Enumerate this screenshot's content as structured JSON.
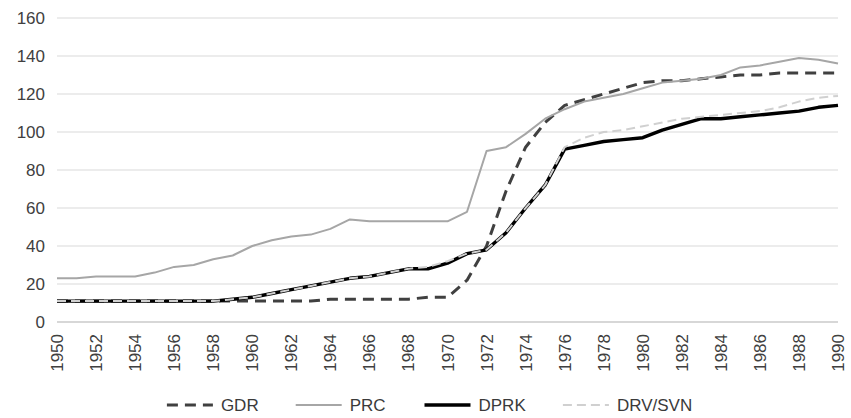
{
  "chart_data": {
    "type": "line",
    "title": "",
    "subtitle": "",
    "xlabel": "",
    "ylabel": "",
    "xlim": [
      1950,
      1990
    ],
    "ylim": [
      0,
      160
    ],
    "ytick_values": [
      0,
      20,
      40,
      60,
      80,
      100,
      120,
      140,
      160
    ],
    "ytick_labels": [
      "0",
      "20",
      "40",
      "60",
      "80",
      "100",
      "120",
      "140",
      "160"
    ],
    "xtick_values": [
      1950,
      1952,
      1954,
      1956,
      1958,
      1960,
      1962,
      1964,
      1966,
      1968,
      1970,
      1972,
      1974,
      1976,
      1978,
      1980,
      1982,
      1984,
      1986,
      1988,
      1990
    ],
    "xtick_labels": [
      "1950",
      "1952",
      "1954",
      "1956",
      "1958",
      "1960",
      "1962",
      "1964",
      "1966",
      "1968",
      "1970",
      "1972",
      "1974",
      "1976",
      "1978",
      "1980",
      "1982",
      "1984",
      "1986",
      "1988",
      "1990"
    ],
    "xtick_rotation": 90,
    "grid": "horizontal",
    "legend_position": "bottom",
    "x": [
      1950,
      1951,
      1952,
      1953,
      1954,
      1955,
      1956,
      1957,
      1958,
      1959,
      1960,
      1961,
      1962,
      1963,
      1964,
      1965,
      1966,
      1967,
      1968,
      1969,
      1970,
      1971,
      1972,
      1973,
      1974,
      1975,
      1976,
      1977,
      1978,
      1979,
      1980,
      1981,
      1982,
      1983,
      1984,
      1985,
      1986,
      1987,
      1988,
      1989,
      1990
    ],
    "series": [
      {
        "name": "GDR",
        "style": "dashed",
        "color": "#404040",
        "width": 3.0,
        "dash": "11,7",
        "values": [
          11,
          11,
          11,
          11,
          11,
          11,
          11,
          11,
          11,
          11,
          11,
          11,
          11,
          11,
          12,
          12,
          12,
          12,
          12,
          13,
          13,
          22,
          40,
          69,
          92,
          105,
          114,
          117,
          120,
          123,
          126,
          127,
          127,
          128,
          129,
          130,
          130,
          131,
          131,
          131,
          131
        ]
      },
      {
        "name": "PRC",
        "style": "solid",
        "color": "#a6a6a6",
        "width": 2.0,
        "dash": "none",
        "values": [
          23,
          23,
          24,
          24,
          24,
          26,
          29,
          30,
          33,
          35,
          40,
          43,
          45,
          46,
          49,
          54,
          53,
          53,
          53,
          53,
          53,
          58,
          90,
          92,
          99,
          107,
          112,
          116,
          118,
          120,
          123,
          126,
          127,
          128,
          130,
          134,
          135,
          137,
          139,
          138,
          136
        ]
      },
      {
        "name": "DPRK",
        "style": "solid",
        "color": "#000000",
        "width": 3.4,
        "dash": "none",
        "values": [
          11,
          11,
          11,
          11,
          11,
          11,
          11,
          11,
          11,
          12,
          13,
          15,
          17,
          19,
          21,
          23,
          24,
          26,
          28,
          28,
          31,
          36,
          38,
          47,
          60,
          72,
          91,
          93,
          95,
          96,
          97,
          101,
          104,
          107,
          107,
          108,
          109,
          110,
          111,
          113,
          114
        ]
      },
      {
        "name": "DRV/SVN",
        "style": "dashed",
        "color": "#d0d0d0",
        "width": 2.0,
        "dash": "9,5",
        "values": [
          11,
          11,
          11,
          11,
          11,
          11,
          11,
          11,
          11,
          12,
          13,
          15,
          17,
          19,
          21,
          23,
          24,
          26,
          28,
          29,
          32,
          36,
          38,
          47,
          60,
          72,
          92,
          97,
          100,
          101,
          103,
          105,
          107,
          108,
          109,
          110,
          111,
          113,
          116,
          118,
          119
        ]
      }
    ]
  },
  "legend": {
    "items": [
      {
        "label": "GDR",
        "color": "#404040",
        "dash": "11,7",
        "width": 3.0
      },
      {
        "label": "PRC",
        "color": "#a6a6a6",
        "dash": "none",
        "width": 2.0
      },
      {
        "label": "DPRK",
        "color": "#000000",
        "dash": "none",
        "width": 3.4
      },
      {
        "label": "DRV/SVN",
        "color": "#d0d0d0",
        "dash": "9,5",
        "width": 2.0
      }
    ]
  }
}
